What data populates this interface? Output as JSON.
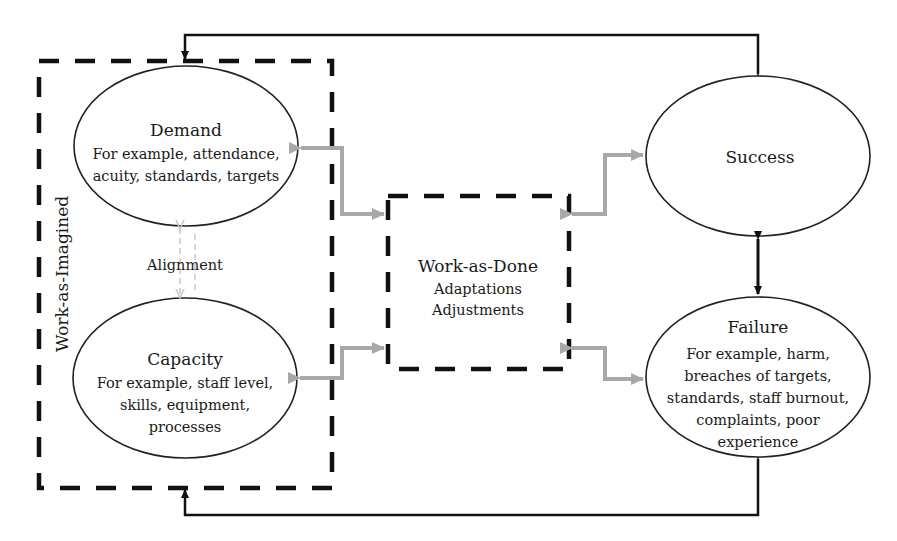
{
  "diagram": {
    "type": "flow",
    "colors": {
      "line": "#111111",
      "feedback_arrow": "#111111",
      "interaction_arrow": "#a8a8a8",
      "alignment_arrow": "#c8c8c8",
      "background": "#ffffff"
    },
    "groups": {
      "work_as_imagined": {
        "label": "Work-as-Imagined"
      },
      "work_as_done": {
        "title": "Work-as-Done",
        "lines": [
          "Adaptations",
          "Adjustments"
        ]
      }
    },
    "nodes": {
      "demand": {
        "title": "Demand",
        "lines": [
          "For example, attendance,",
          "acuity, standards, targets"
        ]
      },
      "capacity": {
        "title": "Capacity",
        "lines": [
          "For example, staff level,",
          "skills, equipment,",
          "processes"
        ]
      },
      "success": {
        "title": "Success",
        "lines": []
      },
      "failure": {
        "title": "Failure",
        "lines": [
          "For example, harm,",
          "breaches of targets,",
          "standards, staff burnout,",
          "complaints, poor",
          "experience"
        ]
      }
    },
    "alignment_label": "Alignment",
    "edges": [
      {
        "from": "demand",
        "to": "work_as_done",
        "style": "gray-bidirectional"
      },
      {
        "from": "capacity",
        "to": "work_as_done",
        "style": "gray-bidirectional"
      },
      {
        "from": "work_as_done",
        "to": "success",
        "style": "gray-bidirectional"
      },
      {
        "from": "work_as_done",
        "to": "failure",
        "style": "gray-bidirectional"
      },
      {
        "from": "demand",
        "to": "capacity",
        "style": "light-dashed-bidirectional",
        "label": "Alignment"
      },
      {
        "from": "success",
        "to": "failure",
        "style": "black-bidirectional"
      },
      {
        "from": "success",
        "to": "work_as_imagined",
        "style": "black-feedback-top"
      },
      {
        "from": "failure",
        "to": "work_as_imagined",
        "style": "black-feedback-bottom"
      }
    ]
  }
}
